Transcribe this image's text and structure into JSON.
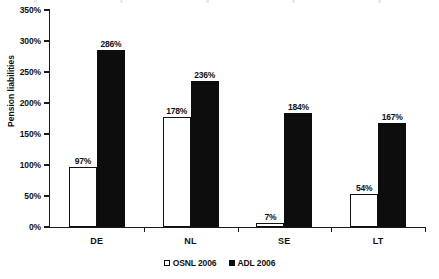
{
  "chart_data": {
    "type": "bar",
    "title": "",
    "xlabel": "",
    "ylabel": "Pension liabilities",
    "categories": [
      "DE",
      "NL",
      "SE",
      "LT"
    ],
    "series": [
      {
        "name": "OSNL 2006",
        "style": "open",
        "values": [
          97,
          178,
          7,
          54
        ],
        "labels": [
          "97%",
          "178%",
          "7%",
          "54%"
        ]
      },
      {
        "name": "ADL 2006",
        "style": "filled",
        "values": [
          286,
          236,
          184,
          167
        ],
        "labels": [
          "286%",
          "236%",
          "184%",
          "167%"
        ]
      }
    ],
    "ylim": [
      0,
      350
    ],
    "ytick_values": [
      0,
      50,
      100,
      150,
      200,
      250,
      300,
      350
    ],
    "ytick_labels": [
      "0%",
      "50%",
      "100%",
      "150%",
      "200%",
      "250%",
      "300%",
      "350%"
    ],
    "grid": false,
    "legend_position": "bottom-center",
    "value_labels_shown": true,
    "colors": {
      "open_fill": "#ffffff",
      "open_stroke": "#111111",
      "filled_fill": "#0d0d0d",
      "axis": "#1a1a1a",
      "text": "#111111",
      "background": "#ffffff"
    }
  }
}
